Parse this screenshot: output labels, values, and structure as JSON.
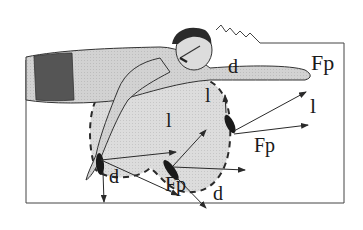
{
  "diagram": {
    "colors": {
      "stroke": "#2a2a2a",
      "body_fill": "#c9c9c9",
      "trunks_fill": "#555555",
      "path_fill": "#d6d6d6",
      "hand_fill": "#1a1a1a",
      "background": "#ffffff"
    },
    "labels": [
      {
        "id": "fp_top",
        "text": "Fp",
        "x": 311,
        "y": 74,
        "size": 22
      },
      {
        "id": "d_top",
        "text": "d",
        "x": 228,
        "y": 76,
        "size": 20
      },
      {
        "id": "l_right",
        "text": "l",
        "x": 310,
        "y": 117,
        "size": 22
      },
      {
        "id": "l_mid_upper",
        "text": "l",
        "x": 205,
        "y": 105,
        "size": 20
      },
      {
        "id": "l_mid",
        "text": "l",
        "x": 166,
        "y": 130,
        "size": 20
      },
      {
        "id": "fp_mid",
        "text": "Fp",
        "x": 254,
        "y": 155,
        "size": 20
      },
      {
        "id": "d_bottom_left",
        "text": "d",
        "x": 109,
        "y": 186,
        "size": 20
      },
      {
        "id": "fp_bottom",
        "text": "Fp",
        "x": 165,
        "y": 194,
        "size": 20
      },
      {
        "id": "d_bottom_right",
        "text": "d",
        "x": 213,
        "y": 203,
        "size": 20
      }
    ]
  }
}
